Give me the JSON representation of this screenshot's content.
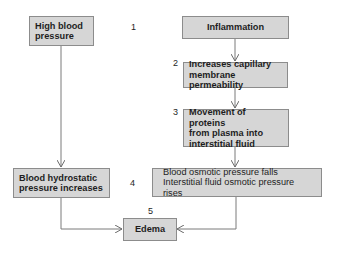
{
  "diagram": {
    "type": "flowchart",
    "nodes": [
      {
        "id": "high_bp",
        "lines": [
          "High blood",
          "pressure"
        ]
      },
      {
        "id": "inflammation",
        "lines": [
          "Inflammation"
        ]
      },
      {
        "id": "permeability",
        "lines": [
          "Increases capillary",
          "membrane permeability"
        ]
      },
      {
        "id": "proteins",
        "lines": [
          "Movement of proteins",
          "from plasma into",
          "interstitial fluid"
        ]
      },
      {
        "id": "hydrostatic",
        "lines": [
          "Blood hydrostatic",
          "pressure increases"
        ]
      },
      {
        "id": "osmotic",
        "lines": [
          "Blood osmotic pressure falls",
          "Interstitial fluid osmotic pressure rises"
        ]
      },
      {
        "id": "edema",
        "lines": [
          "Edema"
        ]
      }
    ],
    "step_numbers": [
      "1",
      "2",
      "3",
      "4",
      "5"
    ],
    "edges": [
      {
        "from": "high_bp",
        "to": "hydrostatic"
      },
      {
        "from": "inflammation",
        "to": "permeability"
      },
      {
        "from": "permeability",
        "to": "proteins"
      },
      {
        "from": "proteins",
        "to": "osmotic"
      },
      {
        "from": "hydrostatic",
        "to": "edema"
      },
      {
        "from": "osmotic",
        "to": "edema"
      }
    ],
    "colors": {
      "box_fill": "#d6d6d6",
      "box_border": "#8c8c8c",
      "line": "#7a7a7a",
      "text": "#1e1e1e"
    }
  }
}
